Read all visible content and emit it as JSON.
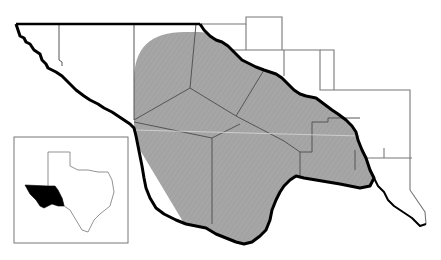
{
  "map": {
    "type": "regional locator map",
    "description": "Trans-Pecos region of West Texas with shaded study area",
    "colors": {
      "shaded_area": "#a6a6a6",
      "county_lines": "#555555",
      "river_border": "#000000",
      "background": "#ffffff",
      "inset_highlight": "#000000"
    },
    "layers": [
      "county-boundaries",
      "shaded-range",
      "rio-grande-border",
      "state-line-new-mexico"
    ],
    "inset": {
      "label": "texas-locator-inset",
      "highlighted_region": "trans-pecos"
    }
  }
}
